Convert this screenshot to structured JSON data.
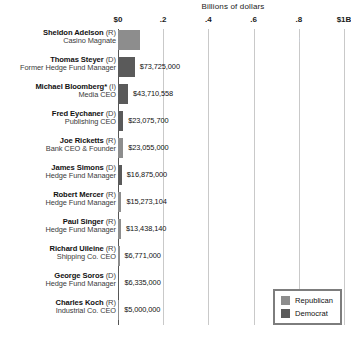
{
  "chart_data": {
    "type": "bar",
    "title": "Billions of dollars",
    "orientation": "horizontal",
    "xlabel": "Billions of dollars",
    "ylabel": "",
    "xlim": [
      0,
      1000000000
    ],
    "grid": true,
    "legend_position": "bottom-right",
    "tick_labels": [
      "$0",
      ".2",
      ".4",
      ".6",
      ".8",
      "$1B"
    ],
    "tick_values": [
      0,
      200000000,
      400000000,
      600000000,
      800000000,
      1000000000
    ],
    "categories": [
      "Sheldon Adelson",
      "Thomas Steyer",
      "Michael Bloomberg*",
      "Fred Eychaner",
      "Joe Ricketts",
      "James Simons",
      "Robert Mercer",
      "Paul Singer",
      "Richard Uileine",
      "George Soros",
      "Charles Koch"
    ],
    "values": [
      98320861,
      73725000,
      43710558,
      23075700,
      23055000,
      16875000,
      15273104,
      13438140,
      6771000,
      6335000,
      5000000
    ],
    "value_labels": [
      "$98,320,861",
      "$73,725,000",
      "$43,710,558",
      "$23,075,700",
      "$23,055,000",
      "$16,875,000",
      "$15,273,104",
      "$13,438,140",
      "$6,771,000",
      "$6,335,000",
      "$5,000,000"
    ],
    "bars": [
      {
        "name": "Sheldon Adelson",
        "party": "(R)",
        "party_key": "rep",
        "role": "Casino Magnate",
        "value": 98320861,
        "value_label": "$98,320,861",
        "bar_pct": 98.3,
        "label_inside": true
      },
      {
        "name": "Thomas Steyer",
        "party": "(D)",
        "party_key": "dem",
        "role": "Former Hedge Fund Manager",
        "value": 73725000,
        "value_label": "$73,725,000",
        "bar_pct": 73.7,
        "label_inside": false
      },
      {
        "name": "Michael Bloomberg*",
        "party": "(I)",
        "party_key": "ind",
        "role": "Media CEO",
        "value": 43710558,
        "value_label": "$43,710,558",
        "bar_pct": 43.7,
        "label_inside": false
      },
      {
        "name": "Fred Eychaner",
        "party": "(D)",
        "party_key": "dem",
        "role": "Publishing CEO",
        "value": 23075700,
        "value_label": "$23,075,700",
        "bar_pct": 23.1,
        "label_inside": false
      },
      {
        "name": "Joe Ricketts",
        "party": "(R)",
        "party_key": "rep",
        "role": "Bank CEO & Founder",
        "value": 23055000,
        "value_label": "$23,055,000",
        "bar_pct": 23.0,
        "label_inside": false
      },
      {
        "name": "James Simons",
        "party": "(D)",
        "party_key": "dem",
        "role": "Hedge Fund Manager",
        "value": 16875000,
        "value_label": "$16,875,000",
        "bar_pct": 16.9,
        "label_inside": false
      },
      {
        "name": "Robert Mercer",
        "party": "(R)",
        "party_key": "rep",
        "role": "Hedge Fund Manager",
        "value": 15273104,
        "value_label": "$15,273,104",
        "bar_pct": 15.3,
        "label_inside": false
      },
      {
        "name": "Paul Singer",
        "party": "(R)",
        "party_key": "rep",
        "role": "Hedge Fund Manager",
        "value": 13438140,
        "value_label": "$13,438,140",
        "bar_pct": 13.4,
        "label_inside": false
      },
      {
        "name": "Richard Uileine",
        "party": "(R)",
        "party_key": "rep",
        "role": "Shipping Co. CEO",
        "value": 6771000,
        "value_label": "$6,771,000",
        "bar_pct": 6.8,
        "label_inside": false
      },
      {
        "name": "George Soros",
        "party": "(D)",
        "party_key": "dem",
        "role": "Hedge Fund Manager",
        "value": 6335000,
        "value_label": "$6,335,000",
        "bar_pct": 6.3,
        "label_inside": false
      },
      {
        "name": "Charles Koch",
        "party": "(R)",
        "party_key": "rep",
        "role": "Industrial Co. CEO",
        "value": 5000000,
        "value_label": "$5,000,000",
        "bar_pct": 5.0,
        "label_inside": false
      }
    ],
    "legend": [
      {
        "label": "Republican",
        "key": "rep",
        "color": "#8d8d8d"
      },
      {
        "label": "Democrat",
        "key": "dem",
        "color": "#5a5a5a"
      }
    ],
    "colors": {
      "republican": "#8d8d8d",
      "democrat": "#5a5a5a",
      "gridline": "#c9c9c9",
      "axis": "#555555",
      "background": "#ffffff"
    }
  }
}
